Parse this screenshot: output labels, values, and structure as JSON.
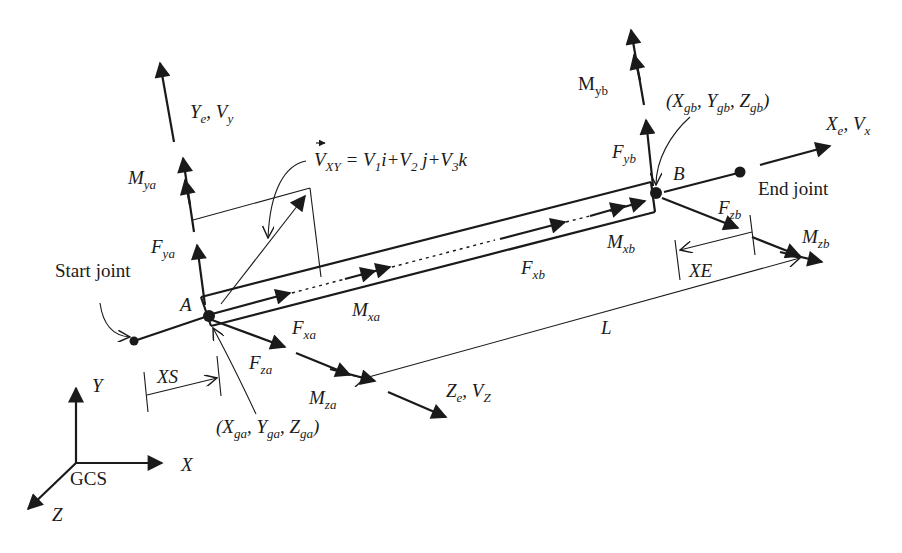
{
  "diagram": {
    "title": "",
    "labels": {
      "local_y_axis": {
        "main": "Y",
        "sub": "e",
        "sep": ", ",
        "main2": "V",
        "sub2": "y"
      },
      "local_x_axis": {
        "main": "X",
        "sub": "e",
        "sep": ", ",
        "main2": "V",
        "sub2": "x"
      },
      "local_z_axis": {
        "main": "Z",
        "sub": "e",
        "sep": ", ",
        "main2": "V",
        "sub2": "Z"
      },
      "vector_eq": {
        "lhs": "V",
        "lhs_sub": "XY",
        "eq": " = ",
        "t1": "V",
        "t1s": "1",
        "t1v": "i",
        "plus1": "+",
        "t2": "V",
        "t2s": "2",
        "t2v": " j",
        "plus2": "+",
        "t3": "V",
        "t3s": "3",
        "t3v": "k"
      },
      "M_ya": {
        "main": "M",
        "sub": "ya"
      },
      "F_ya": {
        "main": "F",
        "sub": "ya"
      },
      "M_yb": {
        "main": "M",
        "sub": "yb"
      },
      "F_yb": {
        "main": "F",
        "sub": "yb"
      },
      "start_joint": "Start joint",
      "end_joint": "End joint",
      "point_A": "A",
      "point_B": "B",
      "M_xa": {
        "main": "M",
        "sub": "xa"
      },
      "F_xa": {
        "main": "F",
        "sub": "xa"
      },
      "F_za": {
        "main": "F",
        "sub": "za"
      },
      "M_za": {
        "main": "M",
        "sub": "za"
      },
      "M_xb": {
        "main": "M",
        "sub": "xb"
      },
      "F_xb": {
        "main": "F",
        "sub": "xb"
      },
      "F_zb": {
        "main": "F",
        "sub": "zb"
      },
      "M_zb": {
        "main": "M",
        "sub": "zb"
      },
      "coord_a": {
        "open": "(",
        "x": "X",
        "xs": "ga",
        "c1": ", ",
        "y": "Y",
        "ys": "ga",
        "c2": ", ",
        "z": "Z",
        "zs": "ga",
        "close": ")"
      },
      "coord_b": {
        "open": "(",
        "x": "X",
        "xs": "gb",
        "c1": ", ",
        "y": "Y",
        "ys": "gb",
        "c2": ", ",
        "z": "Z",
        "zs": "gb",
        "close": ")"
      },
      "XS": "XS",
      "XE": "XE",
      "L": "L",
      "gcs": "GCS",
      "gcs_x": "X",
      "gcs_y": "Y",
      "gcs_z": "Z"
    },
    "colors": {
      "ink": "#1a1a1a",
      "background": "#ffffff"
    }
  }
}
